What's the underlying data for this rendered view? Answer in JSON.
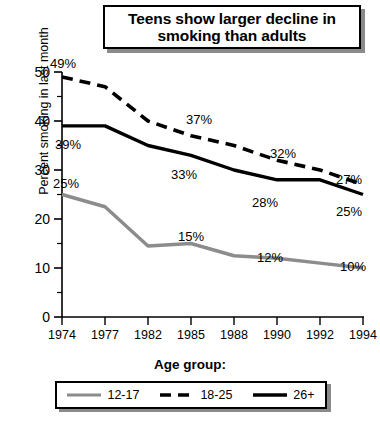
{
  "chart_data": {
    "type": "line",
    "title": "Teens show larger decline in smoking than adults",
    "xlabel": "",
    "ylabel": "Percent smoking in last month",
    "categories": [
      "1974",
      "1977",
      "1982",
      "1985",
      "1988",
      "1990",
      "1992",
      "1994"
    ],
    "ylim": [
      0,
      50
    ],
    "yticks": [
      0,
      10,
      20,
      30,
      40,
      50
    ],
    "ytick_labels": [
      "0",
      "10",
      "20",
      "30",
      "40",
      "50"
    ],
    "minor_tick_step": 5,
    "grid": false,
    "legend_position": "bottom",
    "legend_title": "Age group:",
    "series": [
      {
        "name": "12-17",
        "style": "solid",
        "color": "#8c8c8c",
        "values": [
          25,
          22.5,
          14.5,
          15,
          12.5,
          12,
          11,
          10
        ],
        "labels": [
          {
            "category": "1974",
            "text": "25%"
          },
          {
            "category": "1985",
            "text": "15%"
          },
          {
            "category": "1990",
            "text": "12%"
          },
          {
            "category": "1994",
            "text": "10%"
          }
        ]
      },
      {
        "name": "18-25",
        "style": "dashed",
        "color": "#000000",
        "values": [
          49,
          47,
          40,
          37,
          35,
          32,
          30,
          27
        ],
        "labels": [
          {
            "category": "1974",
            "text": "49%"
          },
          {
            "category": "1985",
            "text": "37%"
          },
          {
            "category": "1990",
            "text": "32%"
          },
          {
            "category": "1994",
            "text": "27%"
          }
        ]
      },
      {
        "name": "26+",
        "style": "solid",
        "color": "#000000",
        "values": [
          39,
          39,
          35,
          33,
          30,
          28,
          28,
          25
        ],
        "labels": [
          {
            "category": "1974",
            "text": "39%"
          },
          {
            "category": "1985",
            "text": "33%"
          },
          {
            "category": "1990",
            "text": "28%"
          },
          {
            "category": "1994",
            "text": "25%"
          }
        ]
      }
    ]
  },
  "title": {
    "line1": "Teens show larger decline in",
    "line2": "smoking than adults"
  },
  "axis": {
    "ylabel": "Percent smoking in last month",
    "ytick_0": "0",
    "ytick_10": "10",
    "ytick_20": "20",
    "ytick_30": "30",
    "ytick_40": "40",
    "ytick_50": "50",
    "xtick_1974": "1974",
    "xtick_1977": "1977",
    "xtick_1982": "1982",
    "xtick_1985": "1985",
    "xtick_1988": "1988",
    "xtick_1990": "1990",
    "xtick_1992": "1992",
    "xtick_1994": "1994"
  },
  "annotations": {
    "teen_1974": "25%",
    "teen_1985": "15%",
    "teen_1990": "12%",
    "teen_1994": "10%",
    "young_1974": "49%",
    "young_1985": "37%",
    "young_1990": "32%",
    "young_1994": "27%",
    "adult_1974": "39%",
    "adult_1985": "33%",
    "adult_1990": "28%",
    "adult_1994": "25%"
  },
  "legend": {
    "title": "Age group:",
    "items": [
      {
        "label": "12-17"
      },
      {
        "label": "18-25"
      },
      {
        "label": "26+"
      }
    ]
  },
  "colors": {
    "teen_line": "#8c8c8c",
    "young_line": "#000000",
    "adult_line": "#000000",
    "shadow": "#8a8a8a"
  }
}
